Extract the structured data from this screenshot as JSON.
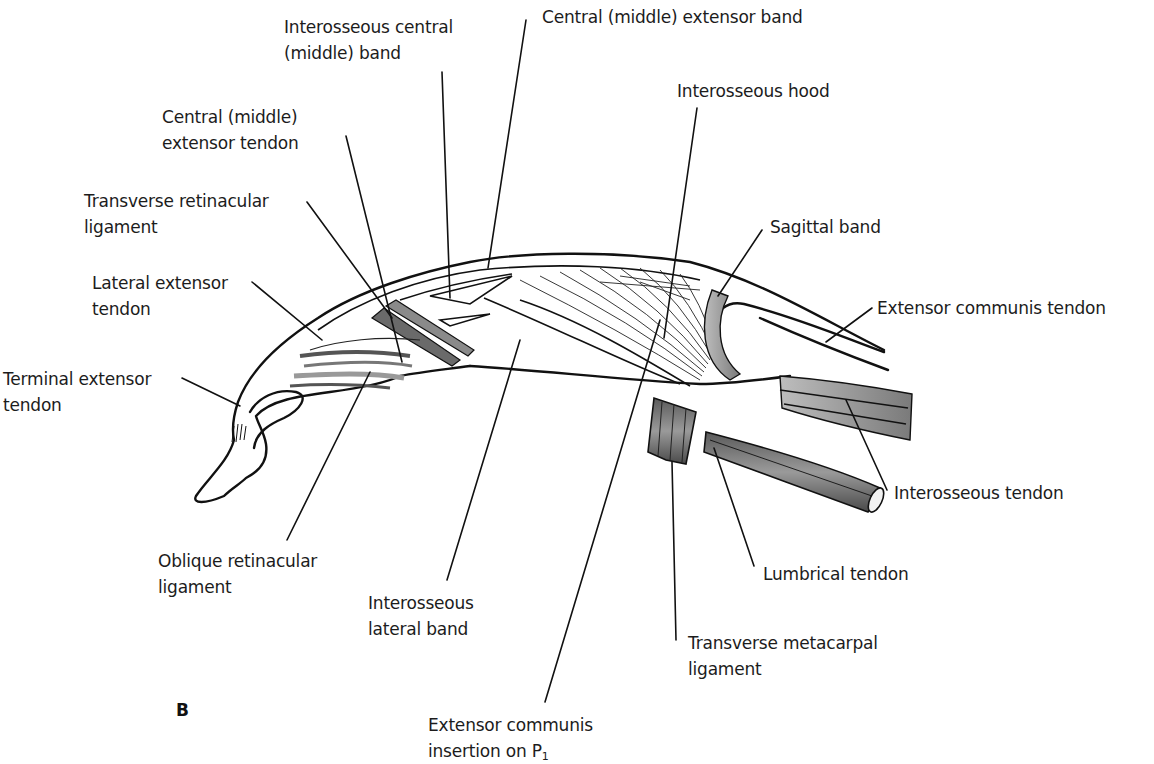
{
  "figure": {
    "panel_letter": "B"
  },
  "labels": [
    {
      "id": "interosseous-central-band",
      "lines": [
        "Interosseous central",
        "(middle) band"
      ],
      "x": 284,
      "y": 14
    },
    {
      "id": "central-extensor-band",
      "lines": [
        "Central (middle) extensor band"
      ],
      "x": 542,
      "y": 4
    },
    {
      "id": "central-extensor-tendon",
      "lines": [
        "Central (middle)",
        "extensor tendon"
      ],
      "x": 162,
      "y": 104
    },
    {
      "id": "interosseous-hood",
      "lines": [
        "Interosseous hood"
      ],
      "x": 677,
      "y": 78
    },
    {
      "id": "transverse-retinacular-ligament",
      "lines": [
        "Transverse retinacular",
        "ligament"
      ],
      "x": 84,
      "y": 188
    },
    {
      "id": "sagittal-band",
      "lines": [
        "Sagittal band"
      ],
      "x": 770,
      "y": 214
    },
    {
      "id": "lateral-extensor-tendon",
      "lines": [
        "Lateral extensor",
        "tendon"
      ],
      "x": 92,
      "y": 270
    },
    {
      "id": "extensor-communis-tendon",
      "lines": [
        "Extensor communis tendon"
      ],
      "x": 877,
      "y": 295
    },
    {
      "id": "terminal-extensor-tendon",
      "lines": [
        "Terminal extensor",
        "tendon"
      ],
      "x": 3,
      "y": 366
    },
    {
      "id": "interosseous-tendon",
      "lines": [
        "Interosseous tendon"
      ],
      "x": 894,
      "y": 480
    },
    {
      "id": "oblique-retinacular-ligament",
      "lines": [
        "Oblique retinacular",
        "ligament"
      ],
      "x": 158,
      "y": 548
    },
    {
      "id": "lumbrical-tendon",
      "lines": [
        "Lumbrical tendon"
      ],
      "x": 763,
      "y": 561
    },
    {
      "id": "interosseous-lateral-band",
      "lines": [
        "Interosseous",
        "lateral band"
      ],
      "x": 368,
      "y": 590
    },
    {
      "id": "transverse-metacarpal-ligament",
      "lines": [
        "Transverse metacarpal",
        "ligament"
      ],
      "x": 688,
      "y": 630
    },
    {
      "id": "extensor-communis-insertion",
      "lines": [
        "Extensor communis",
        "insertion on P"
      ],
      "subscript": "1",
      "x": 428,
      "y": 712
    }
  ],
  "leaders": [
    {
      "for": "interosseous-central-band",
      "x1": 442,
      "y1": 72,
      "x2": 450,
      "y2": 298
    },
    {
      "for": "central-extensor-band",
      "x1": 526,
      "y1": 20,
      "x2": 488,
      "y2": 268
    },
    {
      "for": "central-extensor-tendon",
      "x1": 346,
      "y1": 136,
      "x2": 402,
      "y2": 362
    },
    {
      "for": "interosseous-hood",
      "x1": 697,
      "y1": 108,
      "x2": 664,
      "y2": 338
    },
    {
      "for": "transverse-retinacular-ligament",
      "x1": 307,
      "y1": 202,
      "x2": 392,
      "y2": 318
    },
    {
      "for": "sagittal-band",
      "x1": 762,
      "y1": 230,
      "x2": 718,
      "y2": 296
    },
    {
      "for": "lateral-extensor-tendon",
      "x1": 252,
      "y1": 282,
      "x2": 322,
      "y2": 340
    },
    {
      "for": "extensor-communis-tendon",
      "x1": 872,
      "y1": 308,
      "x2": 826,
      "y2": 342
    },
    {
      "for": "terminal-extensor-tendon",
      "x1": 182,
      "y1": 378,
      "x2": 240,
      "y2": 406
    },
    {
      "for": "interosseous-tendon",
      "x1": 887,
      "y1": 490,
      "x2": 846,
      "y2": 400
    },
    {
      "for": "oblique-retinacular-ligament",
      "x1": 287,
      "y1": 540,
      "x2": 370,
      "y2": 372
    },
    {
      "for": "lumbrical-tendon",
      "x1": 754,
      "y1": 566,
      "x2": 714,
      "y2": 448
    },
    {
      "for": "interosseous-lateral-band",
      "x1": 447,
      "y1": 580,
      "x2": 520,
      "y2": 340
    },
    {
      "for": "transverse-metacarpal-ligament",
      "x1": 676,
      "y1": 640,
      "x2": 672,
      "y2": 462
    },
    {
      "for": "extensor-communis-insertion",
      "x1": 545,
      "y1": 702,
      "x2": 660,
      "y2": 320
    }
  ]
}
